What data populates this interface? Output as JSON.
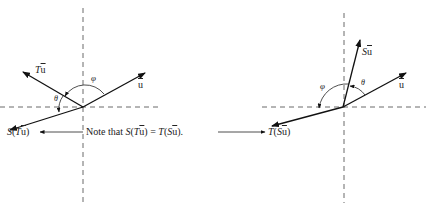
{
  "figure": {
    "left_panel": {
      "vectors": [
        {
          "name": "u",
          "label": "u",
          "from": [
            83,
            107
          ],
          "to": [
            145,
            73
          ]
        },
        {
          "name": "Tu",
          "label": "Tu",
          "from": [
            83,
            107
          ],
          "to": [
            23,
            72
          ]
        },
        {
          "name": "S(Tu)",
          "label": "S(Tu)",
          "from": [
            83,
            107
          ],
          "to": [
            10,
            130
          ]
        }
      ],
      "angles": [
        {
          "symbol": "φ",
          "between": [
            "Tu",
            "u"
          ]
        },
        {
          "symbol": "θ",
          "between": [
            "Tu",
            "S(Tu)"
          ]
        }
      ]
    },
    "right_panel": {
      "vectors": [
        {
          "name": "u",
          "label": "u",
          "from": [
            343,
            107
          ],
          "to": [
            406,
            73
          ]
        },
        {
          "name": "Su",
          "label": "Su",
          "from": [
            343,
            107
          ],
          "to": [
            360,
            40
          ]
        },
        {
          "name": "T(Su)",
          "label": "T(Su)",
          "from": [
            343,
            107
          ],
          "to": [
            272,
            126
          ]
        }
      ],
      "angles": [
        {
          "symbol": "θ",
          "between": [
            "u",
            "Su"
          ]
        },
        {
          "symbol": "φ",
          "between": [
            "Su",
            "T(Su)"
          ]
        }
      ]
    },
    "note": {
      "prefix": "Note that ",
      "lhs_S": "S",
      "lhs_open": "(",
      "lhs_T": "T",
      "u": "u",
      "lhs_close": ")",
      "equals": " = ",
      "rhs_T": "T",
      "rhs_open": "(",
      "rhs_S": "S",
      "rhs_close": ").",
      "full_text": "Note that S(Tū) = T(Sū)."
    },
    "labels": {
      "phi": "φ",
      "theta": "θ",
      "u": "u",
      "S": "S",
      "T": "T",
      "open": "(",
      "close": ")"
    }
  }
}
